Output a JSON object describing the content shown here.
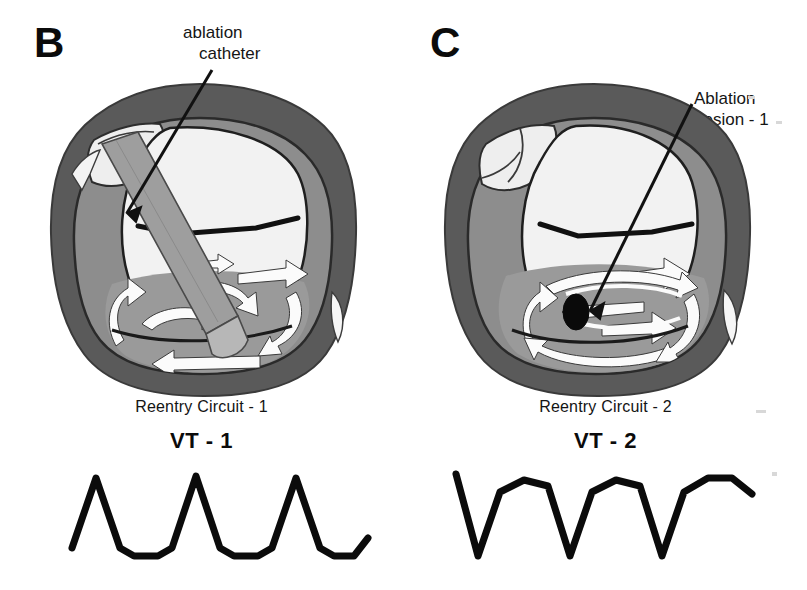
{
  "figure": {
    "background_color": "#ffffff",
    "palette": {
      "epicardium_dark_gray": "#5a5a5a",
      "myocardium_mid_gray": "#8d8d8d",
      "scar_gray": "#9a9a9a",
      "cavity_light": "#ededed",
      "cavity_white": "#f7f7f7",
      "arrow_white": "#fbfbfb",
      "outline_black": "#111111",
      "lesion_black": "#0a0a0a",
      "catheter_gray": "#9e9e9e",
      "catheter_tip_gray": "#b5b5b5",
      "text_black": "#141414"
    }
  },
  "panels": [
    {
      "letter": "B",
      "callout": {
        "name": "ablation-catheter",
        "line1": "ablation",
        "line2": "catheter"
      },
      "anatomy": {
        "has_catheter": true,
        "has_lesion": false
      },
      "caption": {
        "circuit": "Reentry Circuit - 1",
        "vt": "VT - 1"
      },
      "ecg": {
        "name": "vt-1-tracing",
        "morphology": "upright",
        "beats": 3,
        "points": "4,92 28,22 52,92 66,100 90,100 104,92 128,20 152,92 166,100 190,100 204,92 228,22 252,92 266,100 286,100 300,82"
      }
    },
    {
      "letter": "C",
      "callout": {
        "name": "ablation-lesion",
        "line1": "Ablation",
        "line2": "Lesion - 1"
      },
      "anatomy": {
        "has_catheter": false,
        "has_lesion": true
      },
      "caption": {
        "circuit": "Reentry Circuit - 2",
        "vt": "VT - 2"
      },
      "ecg": {
        "name": "vt-2-tracing",
        "morphology": "inverted",
        "beats": 3,
        "points": "4,18 26,100 48,36 72,24 96,30 118,100 140,36 164,24 188,30 210,100 232,36 256,22 280,22 300,38"
      }
    }
  ]
}
